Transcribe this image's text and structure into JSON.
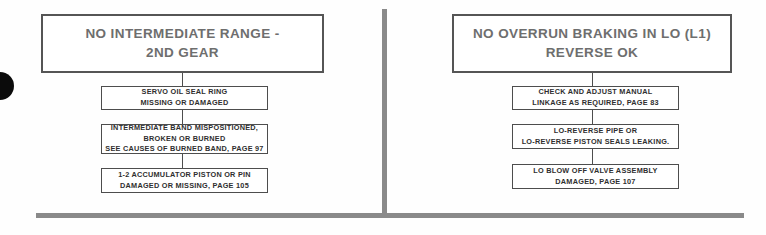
{
  "page": {
    "background_color": "#fefefe",
    "rule_color": "#8a8a8a",
    "box_border_color": "#4d4d4d",
    "title_text_color": "#6e6e6e",
    "step_text_color": "#2f2f2f"
  },
  "artifacts": {
    "hole_blob_name": "page-punch-hole",
    "vertical_divider_name": "column-divider",
    "horizontal_rule_name": "bottom-rule"
  },
  "flowcharts": [
    {
      "id": "no-intermediate-range-2nd-gear",
      "title": "NO INTERMEDIATE RANGE -\n2ND GEAR",
      "steps": [
        "SERVO OIL SEAL RING\nMISSING OR DAMAGED",
        "INTERMEDIATE BAND MISPOSITIONED,\nBROKEN OR BURNED\nSEE CAUSES OF BURNED BAND, PAGE 97",
        "1-2 ACCUMULATOR PISTON OR PIN\nDAMAGED OR MISSING, PAGE 105"
      ]
    },
    {
      "id": "no-overrun-braking-in-lo",
      "title": "NO OVERRUN BRAKING IN LO (L1)\nREVERSE OK",
      "steps": [
        "CHECK AND ADJUST MANUAL\nLINKAGE AS REQUIRED, PAGE 83",
        "LO-REVERSE PIPE OR\nLO-REVERSE PISTON SEALS LEAKING.",
        "LO BLOW OFF VALVE ASSEMBLY\nDAMAGED, PAGE 107"
      ]
    }
  ]
}
